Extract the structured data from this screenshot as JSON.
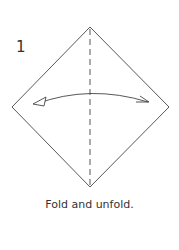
{
  "step": {
    "number": "1",
    "caption": "Fold and unfold."
  },
  "diagram": {
    "shape": "square rotated 45 degrees (diamond)",
    "fold_line": "vertical dashed valley fold",
    "arrow": "double-headed curved arrow, fold and unfold",
    "line_color": "#444444"
  }
}
